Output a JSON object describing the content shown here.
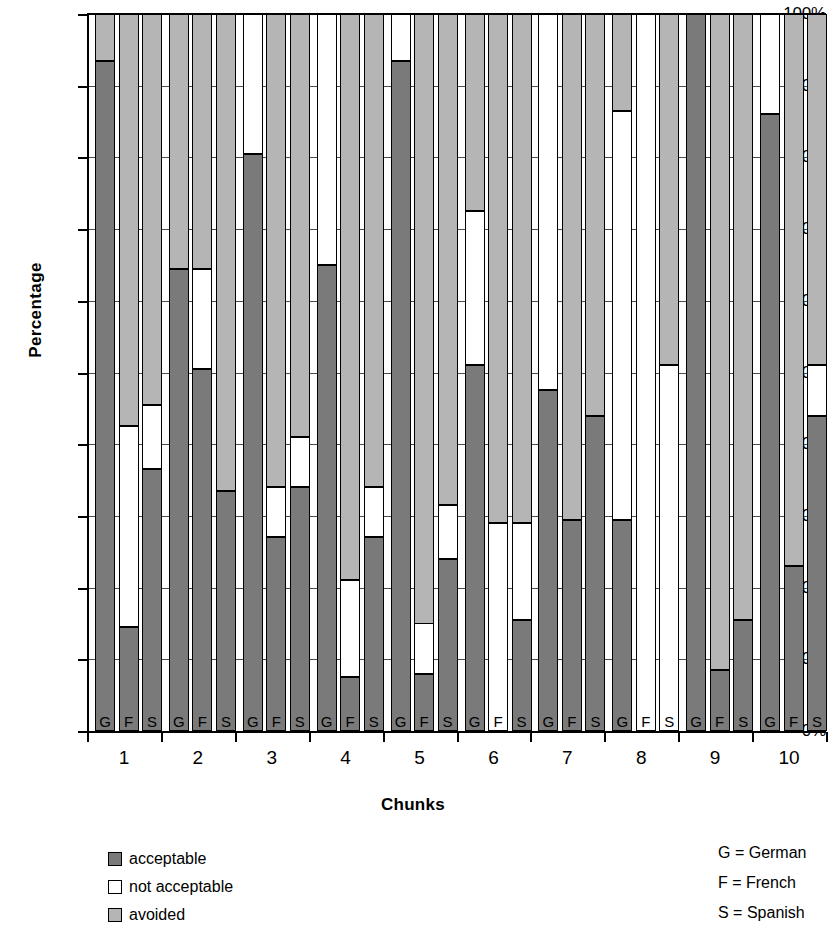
{
  "chart_data": {
    "type": "bar",
    "subtype": "stacked-100-percent",
    "title": "",
    "xlabel": "Chunks",
    "ylabel": "Percentage",
    "ylim": [
      0,
      100
    ],
    "ytick_labels": [
      "0%",
      "10%",
      "20%",
      "30%",
      "40%",
      "50%",
      "60%",
      "70%",
      "80%",
      "90%",
      "100%"
    ],
    "ytick_values": [
      0,
      10,
      20,
      30,
      40,
      50,
      60,
      70,
      80,
      90,
      100
    ],
    "grid": true,
    "legend_position": "bottom-left",
    "categories": [
      "1",
      "2",
      "3",
      "4",
      "5",
      "6",
      "7",
      "8",
      "9",
      "10"
    ],
    "subgroups": [
      "G",
      "F",
      "S"
    ],
    "series": [
      {
        "name": "acceptable",
        "color": "#7a7a7a"
      },
      {
        "name": "not acceptable",
        "color": "#ffffff"
      },
      {
        "name": "avoided",
        "color": "#b5b5b5"
      }
    ],
    "bars": [
      {
        "chunk": "1",
        "lang": "G",
        "acceptable": 93.5,
        "not_acceptable": 0.0,
        "avoided": 6.5
      },
      {
        "chunk": "1",
        "lang": "F",
        "acceptable": 14.5,
        "not_acceptable": 28.0,
        "avoided": 57.5
      },
      {
        "chunk": "1",
        "lang": "S",
        "acceptable": 36.5,
        "not_acceptable": 9.0,
        "avoided": 54.5
      },
      {
        "chunk": "2",
        "lang": "G",
        "acceptable": 64.5,
        "not_acceptable": 0.0,
        "avoided": 35.5
      },
      {
        "chunk": "2",
        "lang": "F",
        "acceptable": 50.5,
        "not_acceptable": 14.0,
        "avoided": 35.5
      },
      {
        "chunk": "2",
        "lang": "S",
        "acceptable": 33.5,
        "not_acceptable": 0.0,
        "avoided": 66.5
      },
      {
        "chunk": "3",
        "lang": "G",
        "acceptable": 80.5,
        "not_acceptable": 19.5,
        "avoided": 0.0
      },
      {
        "chunk": "3",
        "lang": "F",
        "acceptable": 27.0,
        "not_acceptable": 7.0,
        "avoided": 66.0
      },
      {
        "chunk": "3",
        "lang": "S",
        "acceptable": 34.0,
        "not_acceptable": 7.0,
        "avoided": 59.0
      },
      {
        "chunk": "4",
        "lang": "G",
        "acceptable": 65.0,
        "not_acceptable": 35.0,
        "avoided": 0.0
      },
      {
        "chunk": "4",
        "lang": "F",
        "acceptable": 7.5,
        "not_acceptable": 13.5,
        "avoided": 79.0
      },
      {
        "chunk": "4",
        "lang": "S",
        "acceptable": 27.0,
        "not_acceptable": 7.0,
        "avoided": 66.0
      },
      {
        "chunk": "5",
        "lang": "G",
        "acceptable": 93.5,
        "not_acceptable": 6.5,
        "avoided": 0.0
      },
      {
        "chunk": "5",
        "lang": "F",
        "acceptable": 8.0,
        "not_acceptable": 7.0,
        "avoided": 85.0
      },
      {
        "chunk": "5",
        "lang": "S",
        "acceptable": 24.0,
        "not_acceptable": 7.5,
        "avoided": 68.5
      },
      {
        "chunk": "6",
        "lang": "G",
        "acceptable": 51.0,
        "not_acceptable": 21.5,
        "avoided": 27.5
      },
      {
        "chunk": "6",
        "lang": "F",
        "acceptable": 0.0,
        "not_acceptable": 29.0,
        "avoided": 71.0
      },
      {
        "chunk": "6",
        "lang": "S",
        "acceptable": 15.5,
        "not_acceptable": 13.5,
        "avoided": 71.0
      },
      {
        "chunk": "7",
        "lang": "G",
        "acceptable": 47.5,
        "not_acceptable": 52.5,
        "avoided": 0.0
      },
      {
        "chunk": "7",
        "lang": "F",
        "acceptable": 29.5,
        "not_acceptable": 0.0,
        "avoided": 70.5
      },
      {
        "chunk": "7",
        "lang": "S",
        "acceptable": 44.0,
        "not_acceptable": 0.0,
        "avoided": 56.0
      },
      {
        "chunk": "8",
        "lang": "G",
        "acceptable": 29.5,
        "not_acceptable": 57.0,
        "avoided": 13.5
      },
      {
        "chunk": "8",
        "lang": "F",
        "acceptable": 0.0,
        "not_acceptable": 100.0,
        "avoided": 0.0
      },
      {
        "chunk": "8",
        "lang": "S",
        "acceptable": 0.0,
        "not_acceptable": 51.0,
        "avoided": 49.0
      },
      {
        "chunk": "9",
        "lang": "G",
        "acceptable": 100.0,
        "not_acceptable": 0.0,
        "avoided": 0.0
      },
      {
        "chunk": "9",
        "lang": "F",
        "acceptable": 8.5,
        "not_acceptable": 0.0,
        "avoided": 91.5
      },
      {
        "chunk": "9",
        "lang": "S",
        "acceptable": 15.5,
        "not_acceptable": 0.0,
        "avoided": 84.5
      },
      {
        "chunk": "10",
        "lang": "G",
        "acceptable": 86.0,
        "not_acceptable": 14.0,
        "avoided": 0.0
      },
      {
        "chunk": "10",
        "lang": "F",
        "acceptable": 23.0,
        "not_acceptable": 0.0,
        "avoided": 77.0
      },
      {
        "chunk": "10",
        "lang": "S",
        "acceptable": 44.0,
        "not_acceptable": 7.0,
        "avoided": 49.0
      }
    ]
  },
  "legend": {
    "items": [
      {
        "label": "acceptable",
        "key": "acceptable"
      },
      {
        "label": "not acceptable",
        "key": "not-acceptable"
      },
      {
        "label": "avoided",
        "key": "avoided"
      }
    ]
  },
  "key_legend": {
    "rows": [
      "G = German",
      "F = French",
      "S = Spanish"
    ]
  }
}
